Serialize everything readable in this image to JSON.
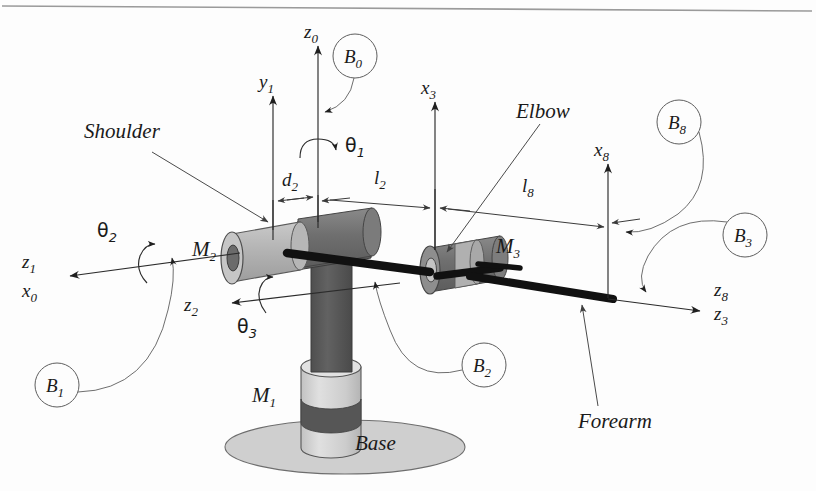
{
  "figure": {
    "top_rule": true,
    "background_color": "#fdfdfd"
  },
  "part_labels": {
    "shoulder": "Shoulder",
    "elbow": "Elbow",
    "forearm": "Forearm",
    "base": "Base"
  },
  "motor_labels": {
    "m1": "M",
    "m1_sub": "1",
    "m2": "M",
    "m2_sub": "2",
    "m3": "M",
    "m3_sub": "3"
  },
  "axis_labels": [
    {
      "name": "z0",
      "base": "z",
      "sub": "0"
    },
    {
      "name": "y1",
      "base": "y",
      "sub": "1"
    },
    {
      "name": "x3",
      "base": "x",
      "sub": "3"
    },
    {
      "name": "x8",
      "base": "x",
      "sub": "8"
    },
    {
      "name": "z1",
      "base": "z",
      "sub": "1"
    },
    {
      "name": "x0",
      "base": "x",
      "sub": "0"
    },
    {
      "name": "z2",
      "base": "z",
      "sub": "2"
    },
    {
      "name": "z8",
      "base": "z",
      "sub": "8"
    },
    {
      "name": "z3",
      "base": "z",
      "sub": "3"
    }
  ],
  "joint_angles": [
    {
      "name": "theta1",
      "base": "θ",
      "sub": "1"
    },
    {
      "name": "theta2",
      "base": "θ",
      "sub": "2"
    },
    {
      "name": "theta3",
      "base": "θ",
      "sub": "3"
    }
  ],
  "dimensions": [
    {
      "name": "d2",
      "base": "d",
      "sub": "2"
    },
    {
      "name": "l2",
      "base": "l",
      "sub": "2"
    },
    {
      "name": "l8",
      "base": "l",
      "sub": "8"
    }
  ],
  "body_frames": [
    {
      "name": "B0",
      "base": "B",
      "sub": "0"
    },
    {
      "name": "B1",
      "base": "B",
      "sub": "1"
    },
    {
      "name": "B2",
      "base": "B",
      "sub": "2"
    },
    {
      "name": "B3",
      "base": "B",
      "sub": "3"
    },
    {
      "name": "B8",
      "base": "B",
      "sub": "8"
    }
  ],
  "colors": {
    "line": "#2b2b2b",
    "hairline": "#5e5e5e",
    "motor_light": "#b8b8b8",
    "motor_dark": "#6f6f6f",
    "hub_dark": "#6b6b6b",
    "column_dark": "#5a5a5a",
    "pedestal_light": "#d2d2d2",
    "pedestal_band": "#565656",
    "base_ellipse": "#cfcfcf",
    "shaft_black": "#111111",
    "text": "#1a1a1a"
  }
}
